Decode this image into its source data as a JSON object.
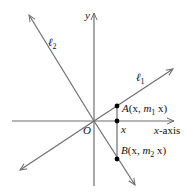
{
  "diagram": {
    "colors": {
      "line": "#6e6e6e",
      "point": "#000000",
      "text": "#111111"
    },
    "axes": {
      "y_label": "y",
      "x_label_var": "x",
      "x_label_suffix": "-axis",
      "origin_label": "O"
    },
    "lines": [
      {
        "id": "l1",
        "label": "ℓ",
        "subscript": "1"
      },
      {
        "id": "l2",
        "label": "ℓ",
        "subscript": "2"
      }
    ],
    "points": {
      "A": {
        "name": "A",
        "open": "(x, ",
        "m": "m",
        "sub": "1",
        "close": " x)"
      },
      "B": {
        "name": "B",
        "open": "(x, ",
        "m": "m",
        "sub": "2",
        "close": " x)"
      },
      "X": {
        "label": "x"
      }
    }
  }
}
